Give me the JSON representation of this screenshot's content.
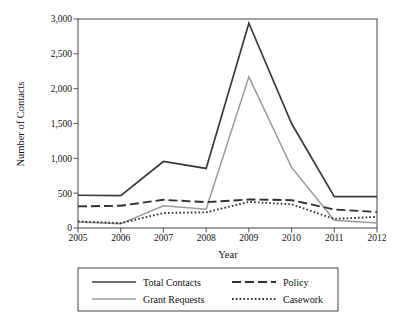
{
  "chart_data": {
    "type": "line",
    "title": "",
    "xlabel": "Year",
    "ylabel": "Number of Contacts",
    "categories": [
      "2005",
      "2006",
      "2007",
      "2008",
      "2009",
      "2010",
      "2011",
      "2012"
    ],
    "x": [
      2005,
      2006,
      2007,
      2008,
      2009,
      2010,
      2011,
      2012
    ],
    "xlim": [
      2005,
      2012
    ],
    "ylim": [
      0,
      3000
    ],
    "ytick_labels": [
      "0",
      "500",
      "1,000",
      "1,500",
      "2,000",
      "2,500",
      "3,000"
    ],
    "ytick_values": [
      0,
      500,
      1000,
      1500,
      2000,
      2500,
      3000
    ],
    "xtick_labels": [
      "2005",
      "2006",
      "2007",
      "2008",
      "2009",
      "2010",
      "2011",
      "2012"
    ],
    "grid": false,
    "legend_position": "below",
    "series": [
      {
        "name": "Total Contacts",
        "style": "solid",
        "color": "#3a3a3a",
        "width": 1.7,
        "values": [
          470,
          465,
          955,
          855,
          2940,
          1500,
          450,
          450
        ]
      },
      {
        "name": "Grant Requests",
        "style": "solid",
        "color": "#9a9a9a",
        "width": 1.5,
        "values": [
          85,
          60,
          320,
          270,
          2170,
          870,
          110,
          70
        ]
      },
      {
        "name": "Policy",
        "style": "dashed",
        "color": "#2f2f2f",
        "width": 1.9,
        "dash": "9,4",
        "values": [
          310,
          320,
          405,
          370,
          410,
          400,
          265,
          230
        ]
      },
      {
        "name": "Casework",
        "style": "dotted",
        "color": "#2f2f2f",
        "width": 1.9,
        "dash": "1.6,2.2",
        "values": [
          95,
          70,
          215,
          225,
          375,
          340,
          130,
          160
        ]
      }
    ]
  },
  "legend": {
    "entries": [
      {
        "label": "Total Contacts"
      },
      {
        "label": "Grant Requests"
      },
      {
        "label": "Policy"
      },
      {
        "label": "Casework"
      }
    ]
  },
  "axes": {
    "y_title": "Number of Contacts",
    "x_title": "Year"
  }
}
